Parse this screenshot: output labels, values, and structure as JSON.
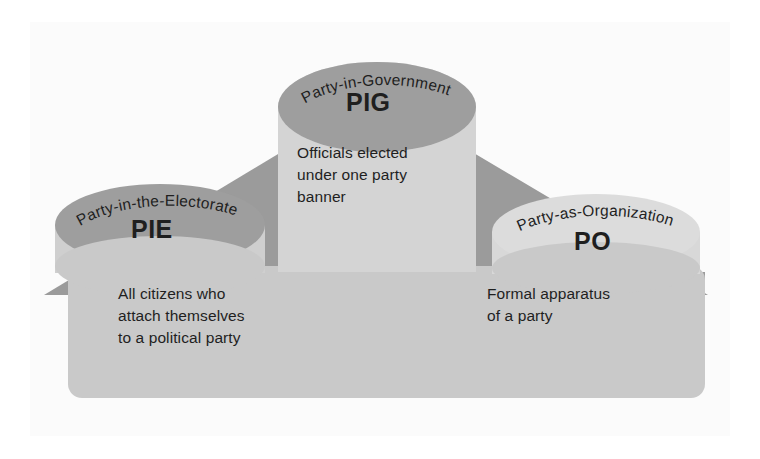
{
  "diagram": {
    "shape": "house",
    "colors": {
      "canvas": "#ffffff",
      "panel": "#fbfbfb",
      "roof_dark": "#9b9b9b",
      "body_light": "#c9c9c9",
      "cylinder_light": "#d8d8d8",
      "cylinder_top_light": "#dcdcdc",
      "text": "#1f1f1f"
    },
    "components": [
      {
        "key": "pie",
        "arc_label": "Party-in-the-Electorate",
        "acronym": "PIE",
        "description": "All citizens who\nattach themselves\nto a political party",
        "top_fill": "dark"
      },
      {
        "key": "pig",
        "arc_label": "Party-in-Government",
        "acronym": "PIG",
        "description": "Officials elected\nunder one party\nbanner",
        "top_fill": "dark"
      },
      {
        "key": "po",
        "arc_label": "Party-as-Organization",
        "acronym": "PO",
        "description": "Formal apparatus\nof a party",
        "top_fill": "light"
      }
    ]
  }
}
